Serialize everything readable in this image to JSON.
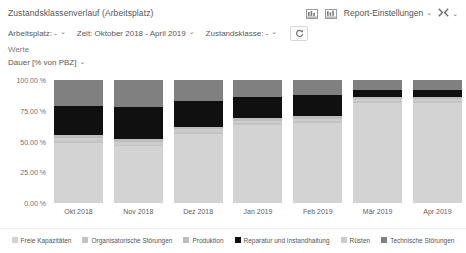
{
  "header": {
    "report_title": "Zustandsklassenverlauf (Arbeitsplatz)",
    "icon_chart_1": "bar-chart-icon",
    "icon_chart_2": "bar-chart-table-icon",
    "settings_label": "Report-Einstellungen",
    "settings_caret": "⌄",
    "expand_icon": "expand-collapse-icon",
    "expand_caret": "⌄"
  },
  "filters": [
    {
      "label": "Arbeitsplatz: -",
      "caret": "⌄",
      "name": "filter-arbeitsplatz"
    },
    {
      "label": "Zeit: Oktober 2018 - April 2019",
      "caret": "⌄",
      "name": "filter-zeit"
    },
    {
      "label": "Zustandsklasse: -",
      "caret": "⌄",
      "name": "filter-zustandsklasse"
    }
  ],
  "refresh": {
    "icon": "refresh-icon"
  },
  "values": {
    "group_label": "Werte",
    "selected": "Dauer [% von PBZ]",
    "caret": "⌄"
  },
  "colors": {
    "freie_kapazitaeten": "#d3d3d3",
    "organisatorische_stoerungen": "#c4c4c4",
    "produktion": "#bdbdbd",
    "reparatur_und_instandhaltung": "#101010",
    "ruesten": "#cccccc",
    "technische_stoerungen": "#808080",
    "axis_text": "#6f6f6f",
    "background": "#ffffff"
  },
  "chart_data": {
    "type": "bar",
    "stacked": true,
    "title": "Zustandsklassenverlauf (Arbeitsplatz)",
    "xlabel": "",
    "ylabel": "Dauer [% von PBZ]",
    "ylim": [
      0,
      100
    ],
    "yticks": [
      0,
      25,
      50,
      75,
      100
    ],
    "ytick_labels": [
      "0.00 %",
      "25.00 %",
      "50.00 %",
      "75.00 %",
      "100.00 %"
    ],
    "grid": false,
    "legend_position": "bottom",
    "categories": [
      "Okt 2018",
      "Nov 2018",
      "Dez 2018",
      "Jan 2019",
      "Feb 2019",
      "Mär 2019",
      "Apr 2019"
    ],
    "series": [
      {
        "name": "Technische Störungen",
        "color": "#808080",
        "values": [
          21.0,
          22.0,
          17.0,
          14.0,
          12.0,
          8.0,
          8.5
        ]
      },
      {
        "name": "Reparatur und Instandhaltung",
        "color": "#101010",
        "values": [
          24.0,
          26.0,
          21.0,
          17.0,
          17.5,
          6.0,
          5.5
        ]
      },
      {
        "name": "Produktion",
        "color": "#bdbdbd",
        "values": [
          2.5,
          2.5,
          2.0,
          2.0,
          2.0,
          1.5,
          1.5
        ]
      },
      {
        "name": "Rüsten",
        "color": "#cccccc",
        "values": [
          2.0,
          2.0,
          2.0,
          2.0,
          2.0,
          1.5,
          1.5
        ]
      },
      {
        "name": "Organisatorische Störungen",
        "color": "#c4c4c4",
        "values": [
          2.0,
          1.5,
          1.5,
          1.5,
          1.5,
          1.5,
          1.5
        ]
      },
      {
        "name": "Freie Kapazitäten",
        "color": "#d3d3d3",
        "values": [
          48.5,
          46.0,
          56.5,
          63.5,
          65.0,
          81.5,
          81.5
        ]
      }
    ]
  },
  "legend": [
    {
      "label": "Freie Kapazitäten",
      "color": "#d3d3d3"
    },
    {
      "label": "Organisatorische Störungen",
      "color": "#c4c4c4"
    },
    {
      "label": "Produktion",
      "color": "#bdbdbd"
    },
    {
      "label": "Reparatur und Instandhaltung",
      "color": "#101010"
    },
    {
      "label": "Rüsten",
      "color": "#cccccc"
    },
    {
      "label": "Technische Störungen",
      "color": "#808080"
    }
  ]
}
